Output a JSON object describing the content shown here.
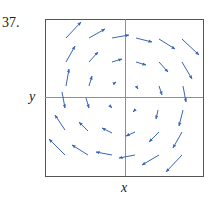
{
  "problem": {
    "number": "37."
  },
  "axes": {
    "x_label": "x",
    "y_label": "y"
  },
  "colors": {
    "arrow": "#3a64b4",
    "frame": "#555555",
    "axis": "#8a8f99"
  },
  "figure": {
    "type": "vector_field",
    "frame": {
      "x": 45,
      "y": 19,
      "width": 158,
      "height": 157
    },
    "origin": {
      "x": 125,
      "y": 97
    },
    "arrows": [
      {
        "x1": 66,
        "y1": 38,
        "x2": 81,
        "y2": 22
      },
      {
        "x1": 89,
        "y1": 38,
        "x2": 105,
        "y2": 29
      },
      {
        "x1": 112,
        "y1": 38,
        "x2": 129,
        "y2": 35
      },
      {
        "x1": 136,
        "y1": 38,
        "x2": 152,
        "y2": 42
      },
      {
        "x1": 159,
        "y1": 39,
        "x2": 175,
        "y2": 49
      },
      {
        "x1": 182,
        "y1": 39,
        "x2": 199,
        "y2": 55
      },
      {
        "x1": 66,
        "y1": 62,
        "x2": 75,
        "y2": 46
      },
      {
        "x1": 89,
        "y1": 62,
        "x2": 98,
        "y2": 52
      },
      {
        "x1": 112,
        "y1": 62,
        "x2": 122,
        "y2": 59
      },
      {
        "x1": 136,
        "y1": 62,
        "x2": 146,
        "y2": 65
      },
      {
        "x1": 159,
        "y1": 62,
        "x2": 168,
        "y2": 72
      },
      {
        "x1": 182,
        "y1": 62,
        "x2": 192,
        "y2": 79
      },
      {
        "x1": 66,
        "y1": 86,
        "x2": 69,
        "y2": 69
      },
      {
        "x1": 89,
        "y1": 86,
        "x2": 92,
        "y2": 76
      },
      {
        "x1": 113,
        "y1": 84,
        "x2": 116,
        "y2": 82
      },
      {
        "x1": 136,
        "y1": 86,
        "x2": 138,
        "y2": 89
      },
      {
        "x1": 159,
        "y1": 86,
        "x2": 162,
        "y2": 95
      },
      {
        "x1": 183,
        "y1": 86,
        "x2": 186,
        "y2": 102
      },
      {
        "x1": 62,
        "y1": 92,
        "x2": 65,
        "y2": 108
      },
      {
        "x1": 86,
        "y1": 98,
        "x2": 89,
        "y2": 108
      },
      {
        "x1": 110,
        "y1": 106,
        "x2": 112,
        "y2": 108
      },
      {
        "x1": 135,
        "y1": 110,
        "x2": 133,
        "y2": 112
      },
      {
        "x1": 158,
        "y1": 110,
        "x2": 156,
        "y2": 119
      },
      {
        "x1": 183,
        "y1": 110,
        "x2": 179,
        "y2": 126
      },
      {
        "x1": 65,
        "y1": 130,
        "x2": 55,
        "y2": 115
      },
      {
        "x1": 88,
        "y1": 131,
        "x2": 79,
        "y2": 122
      },
      {
        "x1": 112,
        "y1": 133,
        "x2": 102,
        "y2": 128
      },
      {
        "x1": 135,
        "y1": 132,
        "x2": 126,
        "y2": 136
      },
      {
        "x1": 159,
        "y1": 132,
        "x2": 149,
        "y2": 142
      },
      {
        "x1": 182,
        "y1": 132,
        "x2": 173,
        "y2": 148
      },
      {
        "x1": 65,
        "y1": 155,
        "x2": 49,
        "y2": 139
      },
      {
        "x1": 88,
        "y1": 155,
        "x2": 72,
        "y2": 145
      },
      {
        "x1": 112,
        "y1": 155,
        "x2": 96,
        "y2": 152
      },
      {
        "x1": 135,
        "y1": 155,
        "x2": 119,
        "y2": 158
      },
      {
        "x1": 159,
        "y1": 155,
        "x2": 142,
        "y2": 165
      },
      {
        "x1": 182,
        "y1": 155,
        "x2": 166,
        "y2": 172
      }
    ]
  }
}
